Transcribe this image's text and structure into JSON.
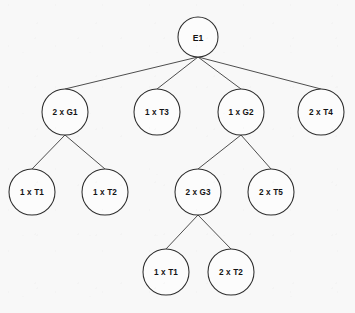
{
  "diagram": {
    "kind": "product-structure-tree",
    "background_color": "#f8f8f8",
    "node_fill_color": "#fcfcfc",
    "node_stroke_color": "#2e2e2e",
    "edge_color": "#3a3a3a",
    "text_color": "#141414",
    "nodes": [
      {
        "id": "e1",
        "label": "E1",
        "cx": 198,
        "cy": 37,
        "r": 20,
        "level": 0
      },
      {
        "id": "g1",
        "label": "2 x G1",
        "cx": 65,
        "cy": 112,
        "r": 23,
        "level": 1
      },
      {
        "id": "t3",
        "label": "1 x T3",
        "cx": 157,
        "cy": 112,
        "r": 23,
        "level": 1
      },
      {
        "id": "g2",
        "label": "1 x G2",
        "cx": 241,
        "cy": 112,
        "r": 23,
        "level": 1
      },
      {
        "id": "t4",
        "label": "2 x T4",
        "cx": 321,
        "cy": 112,
        "r": 23,
        "level": 1
      },
      {
        "id": "t1_left",
        "label": "1 x T1",
        "cx": 32,
        "cy": 192,
        "r": 23,
        "level": 2
      },
      {
        "id": "t2_left",
        "label": "1 x T2",
        "cx": 105,
        "cy": 192,
        "r": 23,
        "level": 2
      },
      {
        "id": "g3",
        "label": "2 x G3",
        "cx": 198,
        "cy": 192,
        "r": 23,
        "level": 2
      },
      {
        "id": "t5",
        "label": "2 x T5",
        "cx": 271,
        "cy": 192,
        "r": 23,
        "level": 2
      },
      {
        "id": "t1_bottom",
        "label": "1 x T1",
        "cx": 166,
        "cy": 272,
        "r": 23,
        "level": 3
      },
      {
        "id": "t2_bottom",
        "label": "2 x T2",
        "cx": 231,
        "cy": 272,
        "r": 23,
        "level": 3
      }
    ],
    "edges": [
      {
        "from": "e1",
        "to": "g1"
      },
      {
        "from": "e1",
        "to": "t3"
      },
      {
        "from": "e1",
        "to": "g2"
      },
      {
        "from": "e1",
        "to": "t4"
      },
      {
        "from": "g1",
        "to": "t1_left"
      },
      {
        "from": "g1",
        "to": "t2_left"
      },
      {
        "from": "g2",
        "to": "g3"
      },
      {
        "from": "g2",
        "to": "t5"
      },
      {
        "from": "g3",
        "to": "t1_bottom"
      },
      {
        "from": "g3",
        "to": "t2_bottom"
      }
    ]
  }
}
